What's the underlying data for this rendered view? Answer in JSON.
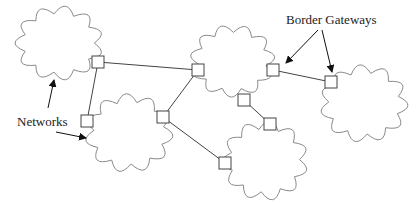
{
  "diagram": {
    "labels": {
      "border_gateways": "Border Gateways",
      "networks": "Networks"
    },
    "networks": [
      {
        "id": "net-a",
        "name": "Network A"
      },
      {
        "id": "net-b",
        "name": "Network B"
      },
      {
        "id": "net-c",
        "name": "Network C"
      },
      {
        "id": "net-d",
        "name": "Network D"
      },
      {
        "id": "net-e",
        "name": "Network E"
      }
    ],
    "gateways": [
      {
        "id": "g1",
        "network": "net-a"
      },
      {
        "id": "g2",
        "network": "net-c"
      },
      {
        "id": "g3",
        "network": "net-b"
      },
      {
        "id": "g4",
        "network": "net-b"
      },
      {
        "id": "g5",
        "network": "net-c"
      },
      {
        "id": "g6",
        "network": "net-c"
      },
      {
        "id": "g7",
        "network": "net-d"
      },
      {
        "id": "g8",
        "network": "net-e"
      },
      {
        "id": "g9",
        "network": "net-d"
      }
    ],
    "links": [
      {
        "from": "g1",
        "to": "g2"
      },
      {
        "from": "g1",
        "to": "g3"
      },
      {
        "from": "g2",
        "to": "g4"
      },
      {
        "from": "g5",
        "to": "g8"
      },
      {
        "from": "g6",
        "to": "g7"
      },
      {
        "from": "g4",
        "to": "g9"
      }
    ],
    "colors": {
      "cloud_stroke": "#8a8a8a",
      "gateway_stroke": "#444444",
      "link_stroke": "#444444",
      "arrow": "#111111",
      "text": "#222222"
    }
  }
}
